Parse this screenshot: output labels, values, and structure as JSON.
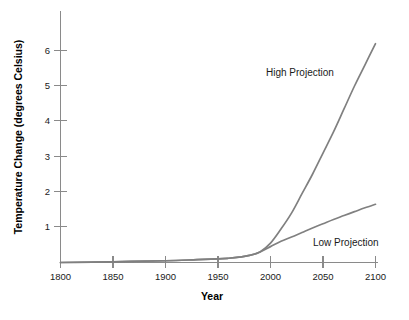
{
  "chart_data": {
    "type": "line",
    "title": "",
    "xlabel": "Year",
    "ylabel": "Temperature Change (degrees Celsius)",
    "xlim": [
      1800,
      2100
    ],
    "ylim": [
      0,
      6.8
    ],
    "grid": false,
    "legend_position": "inline-annotation",
    "line_color": "#808080",
    "axis_color": "#8a8a8a",
    "text_color": "#1a1a1a",
    "background_color": "#ffffff",
    "x_ticks": [
      1800,
      1850,
      1900,
      1950,
      2000,
      2050,
      2100
    ],
    "x_tick_labels": [
      "1800",
      "1850",
      "1900",
      "1950",
      "2000",
      "2050",
      "2100"
    ],
    "y_ticks": [
      1,
      2,
      3,
      4,
      5,
      6
    ],
    "y_tick_labels": [
      "1",
      "2",
      "3",
      "4",
      "5",
      "6"
    ],
    "series": [
      {
        "name": "High Projection",
        "label": "High Projection",
        "x": [
          1800,
          1850,
          1900,
          1930,
          1950,
          1960,
          1970,
          1980,
          1990,
          2000,
          2010,
          2020,
          2030,
          2040,
          2050,
          2060,
          2070,
          2080,
          2090,
          2100
        ],
        "values": [
          0.0,
          0.02,
          0.05,
          0.08,
          0.1,
          0.12,
          0.15,
          0.2,
          0.3,
          0.55,
          0.95,
          1.4,
          1.95,
          2.5,
          3.1,
          3.7,
          4.35,
          5.0,
          5.6,
          6.2
        ]
      },
      {
        "name": "Low Projection",
        "label": "Low Projection",
        "x": [
          1800,
          1850,
          1900,
          1930,
          1950,
          1960,
          1970,
          1980,
          1990,
          2000,
          2010,
          2020,
          2030,
          2040,
          2050,
          2060,
          2070,
          2080,
          2090,
          2100
        ],
        "values": [
          0.0,
          0.02,
          0.05,
          0.08,
          0.1,
          0.12,
          0.15,
          0.2,
          0.3,
          0.45,
          0.6,
          0.72,
          0.85,
          0.98,
          1.1,
          1.22,
          1.33,
          1.44,
          1.55,
          1.65
        ]
      }
    ],
    "annotations": [
      {
        "text": "High Projection",
        "x": 2007,
        "y": 5.3
      },
      {
        "text": "Low Projection",
        "x": 2050,
        "y": 0.55
      }
    ]
  }
}
